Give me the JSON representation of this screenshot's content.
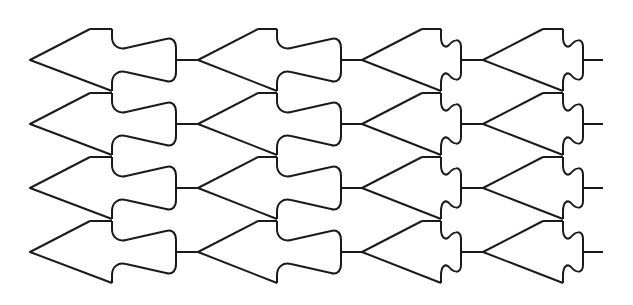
{
  "diagram": {
    "type": "tessellation-line-drawing",
    "stroke_color": "#1a1a1a",
    "background": "#ffffff",
    "stroke_width": 2,
    "rows": {
      "tip_y": [
        60,
        124,
        188,
        252
      ],
      "spacing": 64,
      "half_height": 31
    },
    "columns": [
      {
        "name": "column-1",
        "tip_x": 30,
        "back_x": 90,
        "neck_x": 112,
        "lobe_x": 176,
        "lobe_style": "bulb",
        "connector_to": 198
      },
      {
        "name": "column-2",
        "tip_x": 198,
        "back_x": 258,
        "neck_x": 277,
        "lobe_x": 341,
        "lobe_style": "bulb",
        "connector_to": 362
      },
      {
        "name": "column-3",
        "tip_x": 362,
        "back_x": 422,
        "neck_x": 441,
        "lobe_x": 461,
        "lobe_style": "wiggle",
        "connector_to": 483
      },
      {
        "name": "column-4",
        "tip_x": 483,
        "back_x": 543,
        "neck_x": 563,
        "lobe_x": 583,
        "lobe_style": "wiggle",
        "connector_to": 603
      }
    ]
  }
}
